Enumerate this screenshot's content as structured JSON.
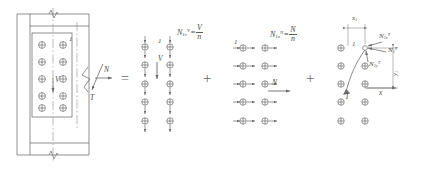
{
  "figure": {
    "type": "structural-engineering-diagram",
    "stroke_color": "#6b6b6b",
    "text_color": "#4a4a4a"
  },
  "operators": {
    "equals": "=",
    "plus_1": "+",
    "plus_2": "+"
  },
  "panel1": {
    "name": "connection-detail",
    "bolt_rows": 5,
    "bolt_cols": 2,
    "labels": {
      "bolt_1": "1",
      "shear_V": "V",
      "axial_N": "N",
      "torsion_T": "T"
    }
  },
  "panel2": {
    "name": "shear-component",
    "bolt_rows": 5,
    "bolt_cols": 2,
    "labels": {
      "bolt_1": "1",
      "shear_V": "V"
    },
    "equation": {
      "lhs_base": "N",
      "lhs_sub": "1v",
      "lhs_sup": "V",
      "numerator": "V",
      "denominator": "n"
    }
  },
  "panel3": {
    "name": "axial-component",
    "bolt_rows": 5,
    "bolt_cols": 2,
    "labels": {
      "bolt_1": "1",
      "axial_N": "N"
    },
    "equation": {
      "lhs_base": "N",
      "lhs_sub": "1x",
      "lhs_sup": "N",
      "numerator": "N",
      "denominator": "n"
    }
  },
  "panel4": {
    "name": "torsion-component",
    "bolt_rows": 5,
    "bolt_cols": 2,
    "labels": {
      "bolt_1": "1",
      "torsion_T": "T",
      "axis_x": "x",
      "dim_x1": "x",
      "dim_x1_sub": "1",
      "dim_y1": "y",
      "dim_y1_sub": "1",
      "force_x_base": "N",
      "force_x_sub": "1x",
      "force_x_sup": "T",
      "force_r_base": "N",
      "force_r_sub": "1",
      "force_r_sup": "T",
      "force_y_base": "N",
      "force_y_sub": "1y",
      "force_y_sup": "T"
    }
  }
}
